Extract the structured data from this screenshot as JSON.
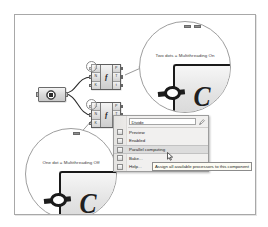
{
  "canvas": {
    "background_color": "#ffffff",
    "border_color": "#a8a8a8"
  },
  "nodes": {
    "curve_param": {
      "name": "curve-parameter",
      "icon": "curve-icon"
    },
    "divide_top": {
      "name": "Divide",
      "glyph": "ƒ",
      "inputs": [
        "C",
        "N",
        "K"
      ],
      "outputs": [
        "P",
        "T",
        "t"
      ]
    },
    "divide_bottom": {
      "name": "Divide",
      "glyph": "ƒ",
      "inputs": [
        "C",
        "N",
        "K"
      ],
      "outputs": [
        "P",
        "T",
        "t"
      ]
    }
  },
  "callouts": {
    "top": {
      "label": "Two dots = Multithreading On",
      "glyph": "C",
      "dot_count": 2
    },
    "bottom": {
      "label": "One dot = Multithreading Off",
      "glyph": "C",
      "dot_count": 1
    }
  },
  "context_menu": {
    "component_name": "Divide",
    "name_field_value": "Divide",
    "items": [
      {
        "label": "Preview",
        "icon": "preview-icon",
        "highlighted": false
      },
      {
        "label": "Enabled",
        "icon": "enabled-icon",
        "highlighted": false
      },
      {
        "label": "Parallel computing",
        "icon": "parallel-computing-icon",
        "highlighted": true
      },
      {
        "label": "Bake...",
        "icon": "bake-icon",
        "highlighted": false
      },
      {
        "label": "Help...",
        "icon": "help-icon",
        "highlighted": false
      }
    ]
  },
  "tooltip": {
    "text": "Assign all available processors to this component"
  },
  "cursor": {
    "type": "arrow-pointer"
  }
}
